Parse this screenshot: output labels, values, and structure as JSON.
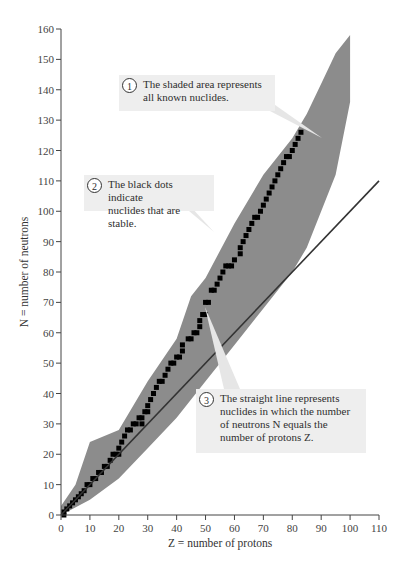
{
  "chart_data": {
    "type": "scatter",
    "title": "",
    "xlabel": "Z = number of protons",
    "ylabel": "N = number of neutrons",
    "xlim": [
      0,
      110
    ],
    "ylim": [
      0,
      160
    ],
    "xticks": [
      0,
      10,
      20,
      30,
      40,
      50,
      60,
      70,
      80,
      90,
      100,
      110
    ],
    "yticks": [
      0,
      10,
      20,
      30,
      40,
      50,
      60,
      70,
      80,
      90,
      100,
      110,
      120,
      130,
      140,
      150,
      160
    ],
    "grid": false,
    "series": [
      {
        "name": "All known nuclides (shaded band)",
        "kind": "area",
        "color": "#8c8c8c",
        "lower_edge": [
          [
            0,
            0
          ],
          [
            10,
            5
          ],
          [
            20,
            12
          ],
          [
            30,
            22
          ],
          [
            40,
            32
          ],
          [
            50,
            44
          ],
          [
            60,
            56
          ],
          [
            70,
            68
          ],
          [
            80,
            80
          ],
          [
            85,
            88
          ],
          [
            90,
            100
          ],
          [
            95,
            112
          ],
          [
            100,
            136
          ]
        ],
        "upper_edge": [
          [
            0,
            3
          ],
          [
            5,
            10
          ],
          [
            10,
            24
          ],
          [
            20,
            28
          ],
          [
            30,
            44
          ],
          [
            40,
            58
          ],
          [
            45,
            72
          ],
          [
            50,
            78
          ],
          [
            60,
            96
          ],
          [
            70,
            112
          ],
          [
            80,
            124
          ],
          [
            85,
            132
          ],
          [
            90,
            142
          ],
          [
            95,
            152
          ],
          [
            100,
            158
          ]
        ]
      },
      {
        "name": "Stable nuclides (black dots)",
        "kind": "points",
        "color": "#000000",
        "points": [
          [
            1,
            0
          ],
          [
            1,
            1
          ],
          [
            2,
            2
          ],
          [
            3,
            3
          ],
          [
            4,
            4
          ],
          [
            5,
            5
          ],
          [
            6,
            6
          ],
          [
            7,
            7
          ],
          [
            8,
            8
          ],
          [
            9,
            10
          ],
          [
            10,
            10
          ],
          [
            11,
            12
          ],
          [
            12,
            12
          ],
          [
            13,
            14
          ],
          [
            14,
            14
          ],
          [
            15,
            16
          ],
          [
            16,
            16
          ],
          [
            17,
            18
          ],
          [
            18,
            20
          ],
          [
            19,
            20
          ],
          [
            20,
            20
          ],
          [
            20,
            22
          ],
          [
            21,
            24
          ],
          [
            22,
            26
          ],
          [
            23,
            28
          ],
          [
            24,
            28
          ],
          [
            25,
            30
          ],
          [
            26,
            30
          ],
          [
            27,
            32
          ],
          [
            28,
            30
          ],
          [
            28,
            32
          ],
          [
            29,
            34
          ],
          [
            30,
            34
          ],
          [
            30,
            36
          ],
          [
            31,
            38
          ],
          [
            32,
            40
          ],
          [
            33,
            42
          ],
          [
            34,
            44
          ],
          [
            35,
            44
          ],
          [
            36,
            46
          ],
          [
            37,
            48
          ],
          [
            38,
            50
          ],
          [
            39,
            50
          ],
          [
            40,
            52
          ],
          [
            41,
            52
          ],
          [
            42,
            54
          ],
          [
            42,
            56
          ],
          [
            44,
            58
          ],
          [
            45,
            58
          ],
          [
            46,
            60
          ],
          [
            47,
            60
          ],
          [
            48,
            62
          ],
          [
            48,
            64
          ],
          [
            49,
            66
          ],
          [
            50,
            66
          ],
          [
            50,
            70
          ],
          [
            51,
            70
          ],
          [
            52,
            74
          ],
          [
            53,
            74
          ],
          [
            54,
            76
          ],
          [
            55,
            78
          ],
          [
            56,
            80
          ],
          [
            57,
            82
          ],
          [
            58,
            82
          ],
          [
            59,
            82
          ],
          [
            60,
            84
          ],
          [
            62,
            86
          ],
          [
            62,
            88
          ],
          [
            63,
            90
          ],
          [
            64,
            92
          ],
          [
            65,
            94
          ],
          [
            66,
            96
          ],
          [
            67,
            98
          ],
          [
            68,
            98
          ],
          [
            69,
            100
          ],
          [
            70,
            102
          ],
          [
            71,
            104
          ],
          [
            72,
            106
          ],
          [
            73,
            108
          ],
          [
            74,
            110
          ],
          [
            75,
            112
          ],
          [
            76,
            114
          ],
          [
            77,
            116
          ],
          [
            78,
            118
          ],
          [
            79,
            118
          ],
          [
            80,
            120
          ],
          [
            81,
            122
          ],
          [
            82,
            124
          ],
          [
            83,
            126
          ]
        ]
      },
      {
        "name": "N = Z line",
        "kind": "line",
        "color": "#333333",
        "x": [
          0,
          110
        ],
        "y": [
          0,
          110
        ]
      }
    ],
    "annotations": [
      {
        "number": "1",
        "text": "The shaded area represents all known nuclides."
      },
      {
        "number": "2",
        "text": "The black dots indicate nuclides that are stable."
      },
      {
        "number": "3",
        "text": "The straight line represents nuclides in which the number of neutrons N equals the number of protons Z."
      }
    ]
  },
  "notes": [
    {
      "num": "1",
      "lines": [
        "The shaded area represents",
        "all known nuclides."
      ]
    },
    {
      "num": "2",
      "lines": [
        "The black dots indicate",
        "nuclides that are stable."
      ]
    },
    {
      "num": "3",
      "lines": [
        "The straight line represents",
        "nuclides in which the number",
        "of neutrons N equals the",
        "number of protons Z."
      ]
    }
  ],
  "axes": {
    "x_title": "Z = number of protons",
    "y_title": "N = number of neutrons"
  }
}
